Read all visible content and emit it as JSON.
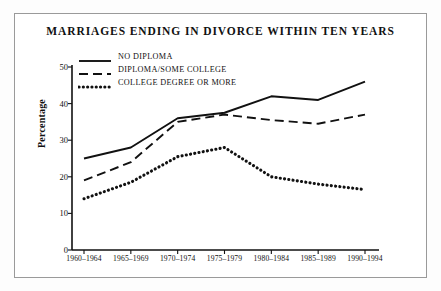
{
  "chart_data": {
    "type": "line",
    "title": "MARRIAGES ENDING IN DIVORCE WITHIN TEN YEARS",
    "xlabel": "",
    "ylabel": "Percentage",
    "categories": [
      "1960–1964",
      "1965–1969",
      "1970–1974",
      "1975–1979",
      "1980–1984",
      "1985–1989",
      "1990–1994"
    ],
    "series": [
      {
        "name": "NO DIPLOMA",
        "style": "solid",
        "color": "#111111",
        "values": [
          25,
          28,
          36,
          37.5,
          42,
          41,
          46
        ]
      },
      {
        "name": "DIPLOMA/SOME COLLEGE",
        "style": "dashed",
        "color": "#111111",
        "values": [
          19,
          24,
          35,
          37,
          35.5,
          34.5,
          37
        ]
      },
      {
        "name": "COLLEGE DEGREE OR MORE",
        "style": "dotted",
        "color": "#111111",
        "values": [
          14,
          18.5,
          25.5,
          28,
          20,
          18,
          16.5
        ]
      }
    ],
    "ylim": [
      0,
      50
    ],
    "y_ticks": [
      0,
      10,
      20,
      30,
      40,
      50
    ],
    "y_tick_labels": [
      "0",
      "10",
      "20",
      "30",
      "40",
      "50"
    ],
    "grid": false,
    "legend_position": "top-left"
  }
}
